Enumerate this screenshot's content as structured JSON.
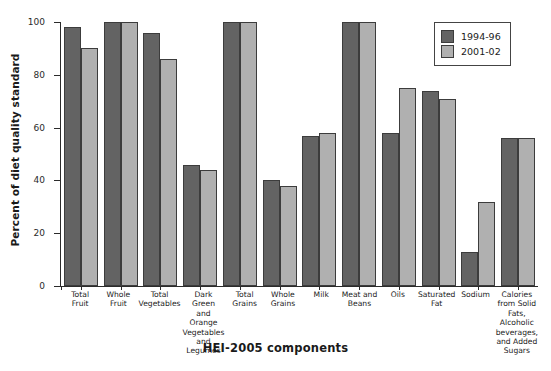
{
  "chart_data": {
    "type": "bar",
    "title": "",
    "xlabel": "HEI-2005 components",
    "ylabel": "Percent of diet quality standard",
    "ylim": [
      0,
      100
    ],
    "yticks": [
      0,
      20,
      40,
      60,
      80,
      100
    ],
    "grid": false,
    "legend_position": "top-right",
    "categories": [
      "Total Fruit",
      "Whole Fruit",
      "Total Vegetables",
      "Dark Green and Orange Vegetables and Legumes",
      "Total Grains",
      "Whole Grains",
      "Milk",
      "Meat and Beans",
      "Oils",
      "Saturated Fat",
      "Sodium",
      "Calories from Solid Fats, Alcoholic beverages, and Added Sugars"
    ],
    "category_lines": [
      [
        "Total",
        "Fruit"
      ],
      [
        "Whole",
        "Fruit"
      ],
      [
        "Total",
        "Vegetables"
      ],
      [
        "Dark",
        "Green",
        "and",
        "Orange",
        "Vegetables",
        "and",
        "Legumes"
      ],
      [
        "Total",
        "Grains"
      ],
      [
        "Whole",
        "Grains"
      ],
      [
        "Milk"
      ],
      [
        "Meat and",
        "Beans"
      ],
      [
        "Oils"
      ],
      [
        "Saturated",
        "Fat"
      ],
      [
        "Sodium"
      ],
      [
        "Calories",
        "from Solid",
        "Fats,",
        "Alcoholic",
        "beverages,",
        "and Added",
        "Sugars"
      ]
    ],
    "series": [
      {
        "name": "1994-96",
        "color": "#636363",
        "values": [
          98,
          100,
          96,
          46,
          100,
          40,
          57,
          100,
          58,
          74,
          13,
          56
        ]
      },
      {
        "name": "2001-02",
        "color": "#b0b0b0",
        "values": [
          90,
          100,
          86,
          44,
          100,
          38,
          58,
          100,
          75,
          71,
          32,
          56
        ]
      }
    ]
  },
  "legend": {
    "items": [
      {
        "label": "1994-96"
      },
      {
        "label": "2001-02"
      }
    ]
  }
}
